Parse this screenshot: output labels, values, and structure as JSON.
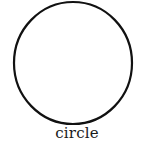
{
  "figure": {
    "shape": "circle",
    "label": "circle",
    "stroke_color": "#111111",
    "fill_color": "#ffffff"
  }
}
